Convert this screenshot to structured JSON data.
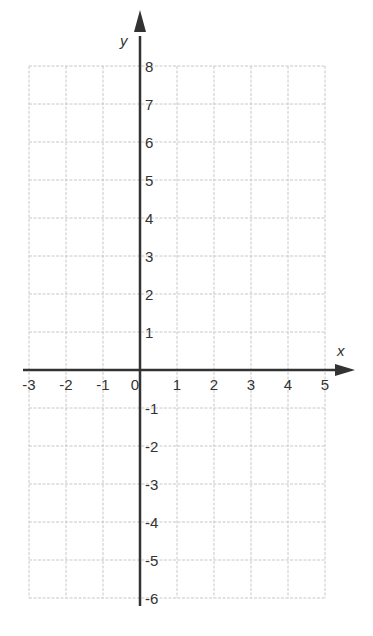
{
  "chart_data": {
    "type": "scatter",
    "title": "",
    "xlabel": "x",
    "ylabel": "y",
    "xlim": [
      -3,
      5
    ],
    "ylim": [
      -6,
      8
    ],
    "xticks": [
      -3,
      -2,
      -1,
      0,
      1,
      2,
      3,
      4,
      5
    ],
    "yticks": [
      -6,
      -5,
      -4,
      -3,
      -2,
      -1,
      1,
      2,
      3,
      4,
      5,
      6,
      7,
      8
    ],
    "xtick_labels": [
      "-3",
      "-2",
      "-1",
      "0",
      "1",
      "2",
      "3",
      "4",
      "5"
    ],
    "ytick_labels": [
      "-6",
      "-5",
      "-4",
      "-3",
      "-2",
      "-1",
      "1",
      "2",
      "3",
      "4",
      "5",
      "6",
      "7",
      "8"
    ],
    "grid": true,
    "points": [],
    "series": []
  },
  "colors": {
    "axis": "#333333",
    "grid": "#c8c8c8",
    "text": "#333333"
  }
}
